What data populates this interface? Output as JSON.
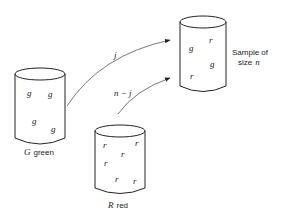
{
  "diagram": {
    "green_urn": {
      "label_var": "G",
      "label_text": "green",
      "balls": [
        "g",
        "g",
        "g",
        "g"
      ]
    },
    "red_urn": {
      "label_var": "R",
      "label_text": "red",
      "balls": [
        "r",
        "r",
        "r",
        "r",
        "r",
        "r"
      ]
    },
    "sample_urn": {
      "label_line1": "Sample of",
      "label_line2_text": "size",
      "label_line2_var": "n",
      "balls": [
        "g",
        "r",
        "g",
        "r"
      ]
    },
    "arrows": {
      "green_to_sample": "j",
      "red_to_sample": "n − j"
    }
  }
}
